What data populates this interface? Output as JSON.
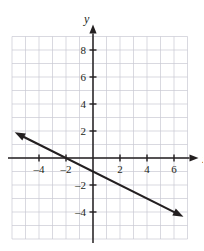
{
  "chart_data": {
    "type": "line",
    "title": "",
    "xlabel": "x",
    "ylabel": "y",
    "xlim": [
      -6,
      7
    ],
    "ylim": [
      -6,
      9
    ],
    "grid": true,
    "grid_step": 1,
    "legend": "none",
    "x_ticks": [
      -4,
      -2,
      2,
      4,
      6
    ],
    "y_ticks": [
      -4,
      -2,
      2,
      4,
      6,
      8
    ],
    "x_tick_labels": [
      "–4",
      "–2",
      "2",
      "4",
      "6"
    ],
    "y_tick_labels": [
      "–4",
      "–2",
      "2",
      "4",
      "6",
      "8"
    ],
    "series": [
      {
        "name": "line",
        "equation": "y = -0.5x - 1",
        "slope": -0.5,
        "intercept": -1,
        "x_intercept": -2,
        "y_intercept": -1,
        "arrows": "both",
        "endpoints": [
          {
            "x": -5.8,
            "y": 1.9
          },
          {
            "x": 6.7,
            "y": -4.35
          }
        ],
        "points": [
          {
            "x": -4,
            "y": 1
          },
          {
            "x": -2,
            "y": 0
          },
          {
            "x": 0,
            "y": -1
          },
          {
            "x": 2,
            "y": -2
          },
          {
            "x": 4,
            "y": -3
          },
          {
            "x": 6,
            "y": -4
          }
        ]
      }
    ]
  },
  "axis_labels": {
    "x": "x",
    "y": "y"
  }
}
